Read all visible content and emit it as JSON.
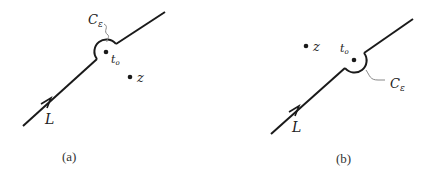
{
  "panels": [
    {
      "id": "a",
      "caption": "(a)",
      "contour_label": "L",
      "indent_label": "C",
      "indent_subscript": "ε",
      "pole_label": "t",
      "pole_subscript": "o",
      "point_label": "z",
      "indent_side": "above (excluding t_o)"
    },
    {
      "id": "b",
      "caption": "(b)",
      "contour_label": "L",
      "indent_label": "C",
      "indent_subscript": "ε",
      "pole_label": "t",
      "pole_subscript": "o",
      "point_label": "z",
      "indent_side": "below (including t_o)"
    }
  ],
  "colors": {
    "stroke": "#1a1a1a",
    "leader": "#888888"
  }
}
